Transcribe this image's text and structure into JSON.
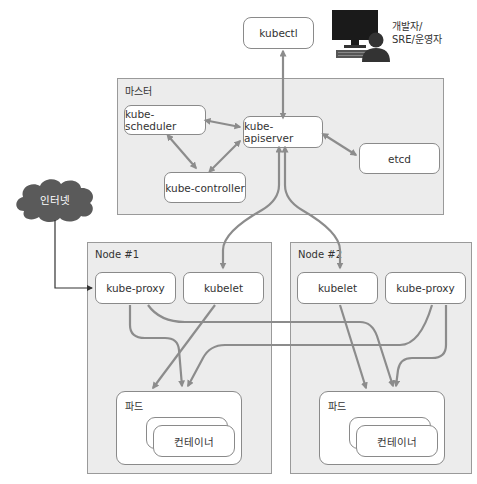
{
  "diagram": {
    "user": {
      "label_line1": "개발자/",
      "label_line2": "SRE/운영자",
      "icon": "developer-workstation-icon"
    },
    "kubectl": {
      "label": "kubectl"
    },
    "master": {
      "label": "마스터",
      "components": {
        "scheduler": "kube-scheduler",
        "apiserver": "kube-apiserver",
        "controller": "kube-controller",
        "etcd": "etcd"
      }
    },
    "internet": {
      "label": "인터넷",
      "icon": "cloud-icon"
    },
    "nodes": [
      {
        "label": "Node #1",
        "proxy": "kube-proxy",
        "kubelet": "kubelet",
        "pod": {
          "label": "파드",
          "container": "컨테이너"
        }
      },
      {
        "label": "Node #2",
        "kubelet": "kubelet",
        "proxy": "kube-proxy",
        "pod": {
          "label": "파드",
          "container": "컨테이너"
        }
      }
    ],
    "colors": {
      "arrow": "#8c8c8c",
      "region_bg": "#ececec",
      "box_border": "#8a8a8a",
      "cloud": "#5a5a5a",
      "monitor": "#1a1a1a"
    }
  }
}
